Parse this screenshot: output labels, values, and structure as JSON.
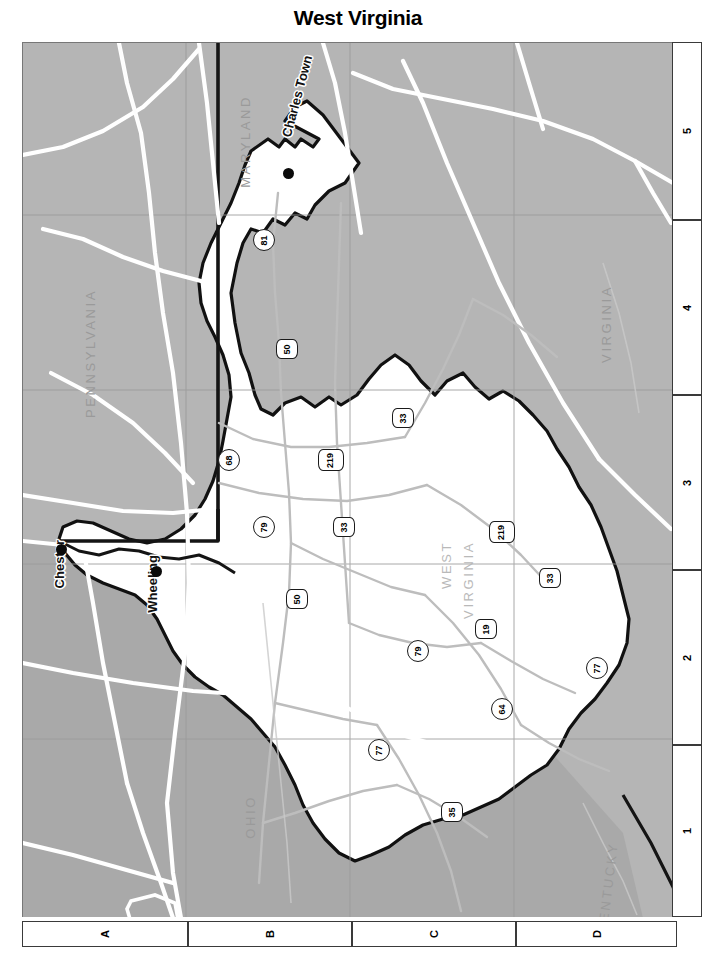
{
  "title": "West Virginia",
  "colors": {
    "neighbor_fill": "#b5b5b5",
    "state_fill": "#ffffff",
    "state_border": "#111111",
    "road_major": "#ffffff",
    "road_minor": "#b8b8b8",
    "grid_line": "#9a9a9a",
    "label_gray": "#9a9a9a",
    "city_dot": "#0a0a0a"
  },
  "map": {
    "orientation": "rotated-90",
    "grid": {
      "columns": [
        "A",
        "B",
        "C",
        "D"
      ],
      "rows": [
        "5",
        "4",
        "3",
        "2",
        "1"
      ]
    },
    "state_labels": [
      {
        "name": "MARYLAND",
        "text": "MARYLAND"
      },
      {
        "name": "PENNSYLVANIA",
        "text": "PENNSYLVANIA"
      },
      {
        "name": "VIRGINIA",
        "text": "VIRGINIA"
      },
      {
        "name": "OHIO",
        "text": "OHIO"
      },
      {
        "name": "KENTUCKY",
        "text": "KENTUCKY"
      },
      {
        "name": "WEST",
        "text": "WEST"
      },
      {
        "name": "VIRGINIA_WV",
        "text": "VIRGINIA"
      }
    ],
    "cities": [
      {
        "name": "Charles Town",
        "label": "Charles Town"
      },
      {
        "name": "Chester",
        "label": "Chester"
      },
      {
        "name": "Wheeling",
        "label": "Wheeling"
      }
    ],
    "shields": [
      {
        "id": "s81",
        "number": "81",
        "type": "interstate"
      },
      {
        "id": "s50a",
        "number": "50",
        "type": "us"
      },
      {
        "id": "s33a",
        "number": "33",
        "type": "us"
      },
      {
        "id": "s68",
        "number": "68",
        "type": "interstate"
      },
      {
        "id": "s219a",
        "number": "219",
        "type": "us"
      },
      {
        "id": "s79a",
        "number": "79",
        "type": "interstate"
      },
      {
        "id": "s33b",
        "number": "33",
        "type": "us"
      },
      {
        "id": "s219b",
        "number": "219",
        "type": "us"
      },
      {
        "id": "s34",
        "number": "33",
        "type": "us"
      },
      {
        "id": "s50b",
        "number": "50",
        "type": "us"
      },
      {
        "id": "s79b",
        "number": "79",
        "type": "interstate"
      },
      {
        "id": "s19",
        "number": "19",
        "type": "us"
      },
      {
        "id": "s77a",
        "number": "77",
        "type": "interstate"
      },
      {
        "id": "s64",
        "number": "64",
        "type": "interstate"
      },
      {
        "id": "s77b",
        "number": "77",
        "type": "interstate"
      },
      {
        "id": "s35",
        "number": "35",
        "type": "us"
      }
    ]
  }
}
